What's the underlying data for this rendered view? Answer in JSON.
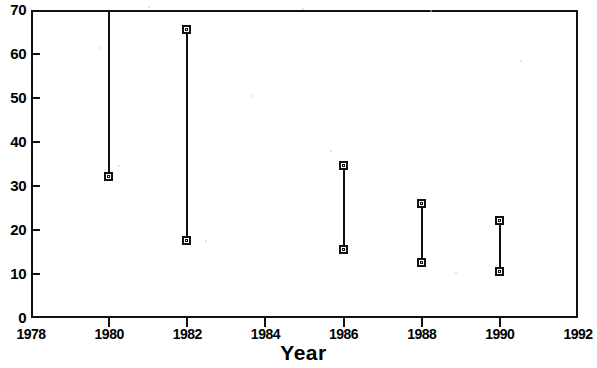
{
  "chart_data": {
    "type": "line",
    "title": "",
    "xlabel": "Year",
    "ylabel": "",
    "xlim": [
      1978,
      1992
    ],
    "ylim": [
      0,
      70
    ],
    "xticks": [
      1978,
      1980,
      1982,
      1984,
      1986,
      1988,
      1990,
      1992
    ],
    "xticklabels": [
      "1978",
      "1980",
      "1982",
      "1984",
      "1986",
      "1988",
      "1990",
      "1992"
    ],
    "yticks": [
      0,
      10,
      20,
      30,
      40,
      50,
      60,
      70
    ],
    "yticklabels": [
      "0",
      "10",
      "20",
      "30",
      "40",
      "50",
      "60",
      "70"
    ],
    "grid": false,
    "legend": null,
    "series_style": "vertical range bars with open square end markers",
    "series": [
      {
        "name": "range",
        "x": [
          1980,
          1982,
          1986,
          1988,
          1990
        ],
        "high": [
          70,
          65.5,
          34.5,
          26,
          22
        ],
        "low": [
          32,
          17.5,
          15.5,
          12.5,
          10.5
        ],
        "high_marker_visible": [
          false,
          true,
          true,
          true,
          true
        ],
        "low_marker_visible": [
          true,
          true,
          true,
          true,
          true
        ],
        "notes": "1980 upper end is clipped at the top axis limit of 70 (no marker drawn)"
      }
    ],
    "points": [
      {
        "year": 1980,
        "low": 32,
        "high": 70
      },
      {
        "year": 1982,
        "low": 17.5,
        "high": 65.5
      },
      {
        "year": 1986,
        "low": 15.5,
        "high": 34.5
      },
      {
        "year": 1988,
        "low": 12.5,
        "high": 26
      },
      {
        "year": 1990,
        "low": 10.5,
        "high": 22
      }
    ],
    "colors": {
      "line": "#111111",
      "marker_face": "#ffffff",
      "marker_edge": "#111111",
      "axis": "#111111",
      "background": "#ffffff"
    }
  }
}
